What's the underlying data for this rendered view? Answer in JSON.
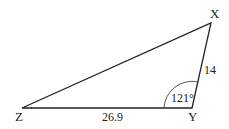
{
  "diagram": {
    "type": "triangle",
    "vertices": {
      "X": {
        "label": "X",
        "x": 211,
        "y": 23
      },
      "Y": {
        "label": "Y",
        "x": 192,
        "y": 108
      },
      "Z": {
        "label": "Z",
        "x": 22,
        "y": 108
      }
    },
    "sides": {
      "XY": {
        "label": "14"
      },
      "YZ": {
        "label": "26.9"
      }
    },
    "angles": {
      "Y": {
        "label": "121°"
      }
    },
    "colors": {
      "stroke": "#222222",
      "background": "#ffffff"
    }
  }
}
